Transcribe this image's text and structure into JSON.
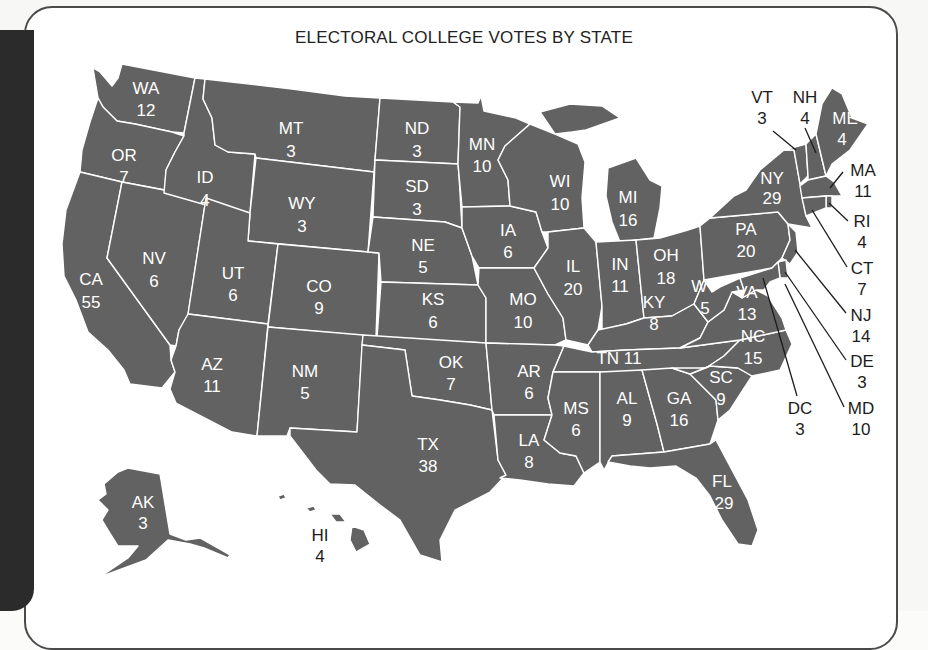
{
  "figure": {
    "title": "ELECTORAL COLLEGE VOTES BY STATE",
    "fill_color": "#626262",
    "border_color": "#ffffff"
  },
  "states": {
    "WA": {
      "abbr": "WA",
      "votes": "12"
    },
    "OR": {
      "abbr": "OR",
      "votes": "7"
    },
    "CA": {
      "abbr": "CA",
      "votes": "55"
    },
    "NV": {
      "abbr": "NV",
      "votes": "6"
    },
    "ID": {
      "abbr": "ID",
      "votes": "4"
    },
    "MT": {
      "abbr": "MT",
      "votes": "3"
    },
    "WY": {
      "abbr": "WY",
      "votes": "3"
    },
    "UT": {
      "abbr": "UT",
      "votes": "6"
    },
    "CO": {
      "abbr": "CO",
      "votes": "9"
    },
    "AZ": {
      "abbr": "AZ",
      "votes": "11"
    },
    "NM": {
      "abbr": "NM",
      "votes": "5"
    },
    "ND": {
      "abbr": "ND",
      "votes": "3"
    },
    "SD": {
      "abbr": "SD",
      "votes": "3"
    },
    "NE": {
      "abbr": "NE",
      "votes": "5"
    },
    "KS": {
      "abbr": "KS",
      "votes": "6"
    },
    "OK": {
      "abbr": "OK",
      "votes": "7"
    },
    "TX": {
      "abbr": "TX",
      "votes": "38"
    },
    "MN": {
      "abbr": "MN",
      "votes": "10"
    },
    "IA": {
      "abbr": "IA",
      "votes": "6"
    },
    "MO": {
      "abbr": "MO",
      "votes": "10"
    },
    "AR": {
      "abbr": "AR",
      "votes": "6"
    },
    "LA": {
      "abbr": "LA",
      "votes": "8"
    },
    "WI": {
      "abbr": "WI",
      "votes": "10"
    },
    "IL": {
      "abbr": "IL",
      "votes": "20"
    },
    "MI": {
      "abbr": "MI",
      "votes": "16"
    },
    "IN": {
      "abbr": "IN",
      "votes": "11"
    },
    "OH": {
      "abbr": "OH",
      "votes": "18"
    },
    "KY": {
      "abbr": "KY",
      "votes": "8"
    },
    "TN": {
      "abbr": "TN",
      "votes": "11",
      "label": "TN 11"
    },
    "MS": {
      "abbr": "MS",
      "votes": "6"
    },
    "AL": {
      "abbr": "AL",
      "votes": "9"
    },
    "GA": {
      "abbr": "GA",
      "votes": "16"
    },
    "FL": {
      "abbr": "FL",
      "votes": "29"
    },
    "SC": {
      "abbr": "SC",
      "votes": "9"
    },
    "NC": {
      "abbr": "NC",
      "votes": "15"
    },
    "VA": {
      "abbr": "VA",
      "votes": "13"
    },
    "WV": {
      "abbr": "WV",
      "votes": "5"
    },
    "PA": {
      "abbr": "PA",
      "votes": "20"
    },
    "NY": {
      "abbr": "NY",
      "votes": "29"
    },
    "VT": {
      "abbr": "VT",
      "votes": "3"
    },
    "NH": {
      "abbr": "NH",
      "votes": "4"
    },
    "ME": {
      "abbr": "ME",
      "votes": "4"
    },
    "MA": {
      "abbr": "MA",
      "votes": "11"
    },
    "RI": {
      "abbr": "RI",
      "votes": "4"
    },
    "CT": {
      "abbr": "CT",
      "votes": "7"
    },
    "NJ": {
      "abbr": "NJ",
      "votes": "14"
    },
    "DE": {
      "abbr": "DE",
      "votes": "3"
    },
    "MD": {
      "abbr": "MD",
      "votes": "10"
    },
    "DC": {
      "abbr": "DC",
      "votes": "3"
    },
    "AK": {
      "abbr": "AK",
      "votes": "3"
    },
    "HI": {
      "abbr": "HI",
      "votes": "4"
    }
  }
}
